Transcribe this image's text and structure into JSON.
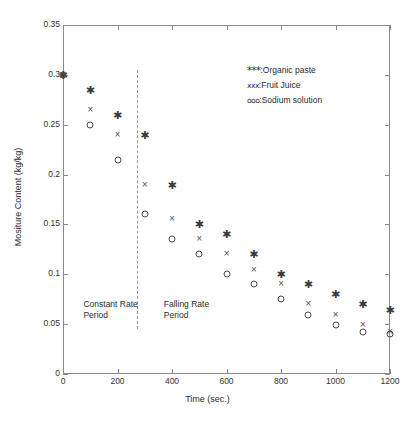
{
  "chart_data": {
    "type": "scatter",
    "title": "",
    "xlabel": "Time (sec.)",
    "ylabel": "Mositure Content (kg/kg)",
    "xlim": [
      0,
      1200
    ],
    "ylim": [
      0,
      0.35
    ],
    "grid": false,
    "legend_position": "upper-right",
    "x": [
      0,
      100,
      200,
      300,
      400,
      500,
      600,
      700,
      800,
      900,
      1000,
      1100,
      1200
    ],
    "xticks": [
      "0",
      "200",
      "400",
      "600",
      "800",
      "1000",
      "1200"
    ],
    "xtick_values": [
      0,
      200,
      400,
      600,
      800,
      1000,
      1200
    ],
    "yticks": [
      "0",
      "0.05",
      "0.1",
      "0.15",
      "0.2",
      "0.25",
      "0.3",
      "0.35"
    ],
    "ytick_values": [
      0,
      0.05,
      0.1,
      0.15,
      0.2,
      0.25,
      0.3,
      0.35
    ],
    "series": [
      {
        "name": "Organic paste",
        "marker": "star",
        "legend_symbol": "***",
        "legend_label": ":Organic paste",
        "values": [
          0.3,
          0.285,
          0.26,
          0.24,
          0.19,
          0.15,
          0.14,
          0.12,
          0.1,
          0.09,
          0.08,
          0.07,
          0.064
        ]
      },
      {
        "name": "Fruit Juice",
        "marker": "cross",
        "legend_symbol": "xxx",
        "legend_label": ":Fruit Juice",
        "values": [
          0.3,
          0.265,
          0.24,
          0.19,
          0.155,
          0.135,
          0.12,
          0.104,
          0.09,
          0.07,
          0.059,
          0.049,
          0.042
        ]
      },
      {
        "name": "Sodium solution",
        "marker": "circle",
        "legend_symbol": "ooo",
        "legend_label": ":Sodium solution",
        "values": [
          0.3,
          0.25,
          0.215,
          0.16,
          0.135,
          0.12,
          0.1,
          0.09,
          0.075,
          0.059,
          0.049,
          0.042,
          0.04
        ]
      }
    ],
    "annotations": [
      {
        "id": "constant-rate",
        "text": "Constant Rate\nPeriod",
        "x": 75,
        "y": 0.0755
      },
      {
        "id": "falling-rate",
        "text": "Falling Rate\nPeriod",
        "x": 370,
        "y": 0.0755
      }
    ],
    "divider": {
      "label": "period-divider",
      "x": 270,
      "y_from": 0.045,
      "y_to": 0.305,
      "style": "dashed"
    }
  }
}
